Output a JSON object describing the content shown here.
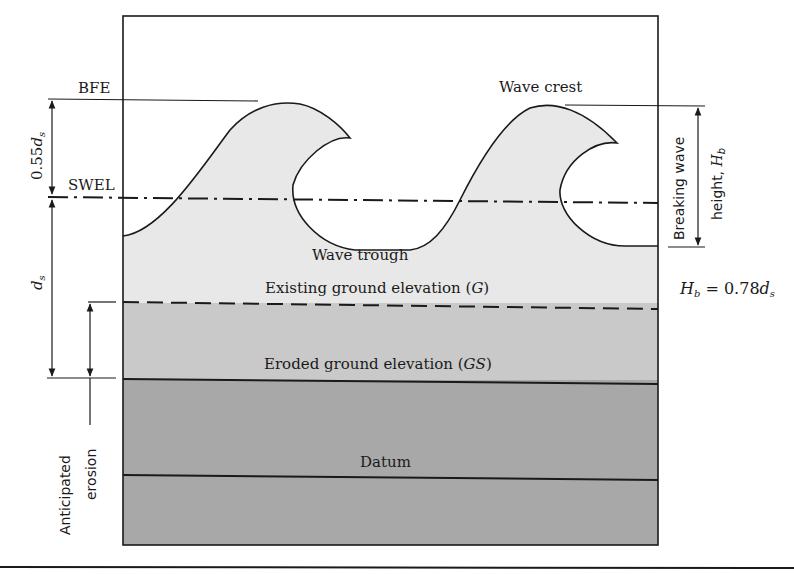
{
  "diagram": {
    "labels": {
      "bfe": "BFE",
      "swel": "SWEL",
      "wave_crest": "Wave crest",
      "wave_trough": "Wave trough",
      "existing_ground": "Existing ground elevation (",
      "existing_ground_sym": "G",
      "eroded_ground": "Eroded ground elevation (",
      "eroded_ground_sym": "GS",
      "close_paren": ")",
      "datum": "Datum",
      "breaking_wave_line1": "Breaking wave",
      "breaking_wave_line2": "height, ",
      "hb_sym": "H",
      "hb_sub": "b",
      "anticipated_line1": "Anticipated",
      "anticipated_line2": "erosion",
      "dim_055_coef": "0.55",
      "ds_sym": "d",
      "ds_sub": "s",
      "equation_lhs": "H",
      "equation_lhs_sub": "b",
      "equation_mid": " = 0.78",
      "equation_rhs": "d",
      "equation_rhs_sub": "s"
    },
    "colors": {
      "water": "#e8e8e8",
      "eroded_zone": "#c9c9c9",
      "ground": "#a8a8a8",
      "line": "#1a1a1a"
    }
  }
}
